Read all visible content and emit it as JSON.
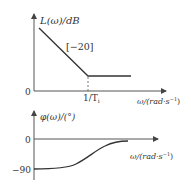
{
  "magnitude_plot": {
    "y_label": "L(ω)/dB",
    "origin_label": "0",
    "slope_label": "[−20]",
    "corner_label_main": "1/T",
    "corner_label_sub": "i",
    "x_label": "ω/(rad·s",
    "x_label_sup": "−1",
    "x_label_close": ")"
  },
  "phase_plot": {
    "y_label": "φ(ω)/(°)",
    "zero_label": "0",
    "neg90_label": "−90",
    "x_label": "ω/(rad·s",
    "x_label_sup": "−1",
    "x_label_close": ")"
  },
  "colors": {
    "line": "#333333",
    "axis": "#555555"
  }
}
